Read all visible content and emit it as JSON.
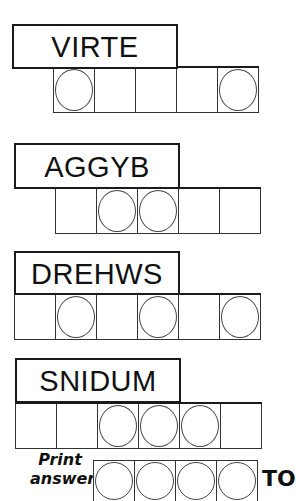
{
  "puzzles": [
    {
      "scrambled": "VIRTE",
      "cells": 5,
      "circled": [
        0,
        4
      ],
      "label": {
        "x": 12,
        "y": 24,
        "w": 166,
        "h": 45
      },
      "row": {
        "x": 53,
        "y": 66
      }
    },
    {
      "scrambled": "AGGYB",
      "cells": 5,
      "circled": [
        1,
        2
      ],
      "label": {
        "x": 14,
        "y": 143,
        "w": 166,
        "h": 46
      },
      "row": {
        "x": 55,
        "y": 187
      }
    },
    {
      "scrambled": "DREHWS",
      "cells": 6,
      "circled": [
        1,
        3,
        5
      ],
      "label": {
        "x": 14,
        "y": 251,
        "w": 166,
        "h": 44
      },
      "row": {
        "x": 14,
        "y": 293
      }
    },
    {
      "scrambled": "SNIDUM",
      "cells": 6,
      "circled": [
        2,
        3,
        4
      ],
      "label": {
        "x": 15,
        "y": 358,
        "w": 166,
        "h": 45
      },
      "row": {
        "x": 15,
        "y": 402
      }
    }
  ],
  "answer": {
    "label_line1": "Print",
    "label_line2": "answer",
    "cells": 4,
    "trailing_text": "TO"
  }
}
